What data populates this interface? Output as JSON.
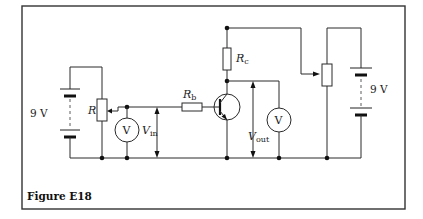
{
  "figure": {
    "caption": "Figure E18"
  },
  "components": {
    "left_battery": {
      "label": "9 V"
    },
    "right_battery": {
      "label": "9 V"
    },
    "input_pot": {
      "label": "R"
    },
    "base_resistor": {
      "label": "R",
      "subscript": "b"
    },
    "collector_resistor": {
      "label": "R",
      "subscript": "c"
    },
    "input_voltmeter": {
      "symbol": "V"
    },
    "output_voltmeter": {
      "symbol": "V"
    },
    "v_in": {
      "label": "V",
      "subscript": "in"
    },
    "v_out": {
      "label": "V",
      "subscript": "out"
    }
  },
  "colors": {
    "line": "#2a2a2a",
    "background": "#ffffff"
  }
}
